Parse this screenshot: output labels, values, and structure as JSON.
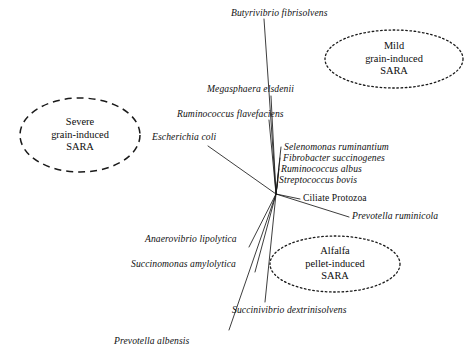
{
  "figure": {
    "type": "biplot-diagram",
    "background_color": "#ffffff",
    "line_color": "#1a1a1a",
    "text_color": "#111111"
  },
  "groups": [
    {
      "id": "severe-grain-induced-sara",
      "line1": "Severe",
      "line2": "grain-induced",
      "line3": "SARA",
      "border_style": "dashed",
      "cx": 80,
      "cy": 135,
      "rx": 60,
      "ry": 37
    },
    {
      "id": "mild-grain-induced-sara",
      "line1": "Mild",
      "line2": "grain-induced",
      "line3": "SARA",
      "border_style": "dotted",
      "cx": 394,
      "cy": 59,
      "rx": 69,
      "ry": 29
    },
    {
      "id": "alfalfa-pellet-induced-sara",
      "line1": "Alfalfa",
      "line2": "pellet-induced",
      "line3": "SARA",
      "border_style": "dotted",
      "cx": 335,
      "cy": 264,
      "rx": 65,
      "ry": 28
    }
  ],
  "origin": {
    "x": 276,
    "y": 194
  },
  "species": [
    {
      "id": "butyrivibrio-fibrisolvens",
      "name": "Butyrivibrio fibrisolvens",
      "italic": true,
      "label_x": 231,
      "label_y": 8,
      "align": "left",
      "line_x": 264,
      "line_y": 19
    },
    {
      "id": "megasphaera-elsdenii",
      "name": "Megasphaera elsdenii",
      "italic": true,
      "label_x": 207,
      "label_y": 84,
      "align": "left",
      "line_x": 271,
      "line_y": 96
    },
    {
      "id": "ruminococcus-flavefaciens",
      "name": "Ruminococcus flavefaciens",
      "italic": true,
      "label_x": 177,
      "label_y": 109,
      "align": "left",
      "line_x": 269,
      "line_y": 120
    },
    {
      "id": "escherichia-coli",
      "name": "Escherichia coli",
      "italic": true,
      "label_x": 152,
      "label_y": 132,
      "align": "left",
      "line_x": 208,
      "line_y": 146
    },
    {
      "id": "selenomonas-ruminantium",
      "name": "Selenomonas ruminantium",
      "italic": true,
      "label_x": 284,
      "label_y": 142,
      "align": "left",
      "line_x": 281,
      "line_y": 147
    },
    {
      "id": "fibrobacter-succinogenes",
      "name": "Fibrobacter succinogenes",
      "italic": true,
      "label_x": 283,
      "label_y": 153,
      "align": "left",
      "line_x": 280,
      "line_y": 158
    },
    {
      "id": "ruminococcus-albus",
      "name": "Ruminococcus albus",
      "italic": true,
      "label_x": 281,
      "label_y": 164,
      "align": "left",
      "line_x": 279,
      "line_y": 169
    },
    {
      "id": "streptococcus-bovis",
      "name": "Streptococcus bovis",
      "italic": true,
      "label_x": 279,
      "label_y": 175,
      "align": "left",
      "line_x": 278,
      "line_y": 180
    },
    {
      "id": "ciliate-protozoa",
      "name": "Ciliate Protozoa",
      "italic": false,
      "label_x": 303,
      "label_y": 193,
      "align": "left",
      "line_x": 300,
      "line_y": 199
    },
    {
      "id": "prevotella-ruminicola",
      "name": "Prevotella ruminicola",
      "italic": true,
      "label_x": 352,
      "label_y": 211,
      "align": "left",
      "line_x": 349,
      "line_y": 217
    },
    {
      "id": "anaerovibrio-lipolytica",
      "name": "Anaerovibrio lipolytica",
      "italic": true,
      "label_x": 145,
      "label_y": 234,
      "align": "left",
      "line_x": 249,
      "line_y": 247
    },
    {
      "id": "succinomonas-amylolytica",
      "name": "Succinomonas amylolytica",
      "italic": true,
      "label_x": 131,
      "label_y": 259,
      "align": "left",
      "line_x": 255,
      "line_y": 272
    },
    {
      "id": "succinivibrio-dextrinisolvens",
      "name": "Succinivibrio dextrinisolvens",
      "italic": true,
      "label_x": 232,
      "label_y": 305,
      "align": "left",
      "line_x": 265,
      "line_y": 302
    },
    {
      "id": "prevotella-albensis",
      "name": "Prevotella albensis",
      "italic": true,
      "label_x": 114,
      "label_y": 336,
      "align": "left",
      "line_x": 229,
      "line_y": 330
    }
  ],
  "vectors": [
    {
      "id": "vector-butyrivibrio-fibrisolvens",
      "x2": 264,
      "y2": 19
    },
    {
      "id": "vector-megasphaera-elsdenii",
      "x2": 271,
      "y2": 96
    },
    {
      "id": "vector-ruminococcus-flavefaciens",
      "x2": 269,
      "y2": 120
    },
    {
      "id": "vector-escherichia-coli",
      "x2": 208,
      "y2": 146
    },
    {
      "id": "vector-selenomonas-ruminantium",
      "x2": 281,
      "y2": 147
    },
    {
      "id": "vector-fibrobacter-succinogenes",
      "x2": 280,
      "y2": 158
    },
    {
      "id": "vector-ruminococcus-albus",
      "x2": 279,
      "y2": 169
    },
    {
      "id": "vector-streptococcus-bovis",
      "x2": 278,
      "y2": 180
    },
    {
      "id": "vector-ciliate-protozoa",
      "x2": 300,
      "y2": 199
    },
    {
      "id": "vector-prevotella-ruminicola",
      "x2": 349,
      "y2": 217
    },
    {
      "id": "vector-anaerovibrio-lipolytica",
      "x2": 249,
      "y2": 247
    },
    {
      "id": "vector-succinomonas-amylolytica",
      "x2": 255,
      "y2": 272
    },
    {
      "id": "vector-succinivibrio-dextrinisolvens",
      "x2": 265,
      "y2": 302
    },
    {
      "id": "vector-prevotella-albensis",
      "x2": 229,
      "y2": 330
    }
  ]
}
